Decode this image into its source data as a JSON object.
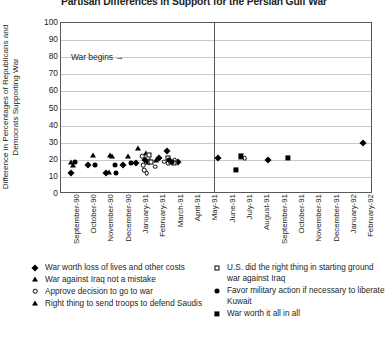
{
  "chart_data": {
    "type": "scatter",
    "title": "Partisan Differences in Support for the Persian Gulf War",
    "xlabel": "",
    "ylabel": "Difference in Percentages of Republicans and Democrats Supporting War",
    "ylim": [
      0,
      100
    ],
    "ytick_labels": [
      "0",
      "10",
      "20",
      "30",
      "40",
      "50",
      "60",
      "70",
      "80",
      "90",
      "100"
    ],
    "ytick_values": [
      0,
      10,
      20,
      30,
      40,
      50,
      60,
      70,
      80,
      90,
      100
    ],
    "grid": "horizontal",
    "legend_position": "below-plot",
    "categories": [
      "September-90",
      "October-90",
      "November-90",
      "December-90",
      "January-91",
      "February-91",
      "March-91",
      "April-91",
      "May-91",
      "June-91",
      "July-91",
      "August-91",
      "September-91",
      "October-91",
      "November-91",
      "December-91",
      "January-92",
      "February-92"
    ],
    "annotations": [
      {
        "text": "War begins",
        "arrow": "→",
        "x_category": "January-91",
        "y": 87
      }
    ],
    "series": [
      {
        "name": "War worth loss of lives and other costs",
        "marker": "diamond-filled",
        "points": [
          {
            "x": 0.05,
            "y": 12
          },
          {
            "x": 1.05,
            "y": 17
          },
          {
            "x": 2.1,
            "y": 12
          },
          {
            "x": 3.05,
            "y": 17
          },
          {
            "x": 3.8,
            "y": 18
          },
          {
            "x": 4.35,
            "y": 20
          },
          {
            "x": 4.55,
            "y": 19
          },
          {
            "x": 5.15,
            "y": 21
          },
          {
            "x": 5.6,
            "y": 25
          },
          {
            "x": 6.25,
            "y": 19
          },
          {
            "x": 8.55,
            "y": 21
          },
          {
            "x": 11.45,
            "y": 20
          },
          {
            "x": 16.9,
            "y": 30
          }
        ]
      },
      {
        "name": "War against Iraq not a mistake",
        "marker": "triangle-filled",
        "points": [
          {
            "x": 0.1,
            "y": 19
          },
          {
            "x": 1.35,
            "y": 23
          },
          {
            "x": 2.35,
            "y": 23
          },
          {
            "x": 3.35,
            "y": 22
          },
          {
            "x": 3.95,
            "y": 27
          },
          {
            "x": 4.4,
            "y": 24
          },
          {
            "x": 4.62,
            "y": 20
          },
          {
            "x": 5.0,
            "y": 20
          }
        ]
      },
      {
        "name": "Approve decision to go to war",
        "marker": "circle-open",
        "points": [
          {
            "x": 4.2,
            "y": 22
          },
          {
            "x": 4.25,
            "y": 17
          },
          {
            "x": 4.3,
            "y": 14
          },
          {
            "x": 4.45,
            "y": 12
          },
          {
            "x": 4.95,
            "y": 16
          },
          {
            "x": 5.45,
            "y": 19
          },
          {
            "x": 5.7,
            "y": 18
          },
          {
            "x": 6.05,
            "y": 20
          },
          {
            "x": 10.1,
            "y": 21
          }
        ]
      },
      {
        "name": "Right thing to send troops to defend Saudis",
        "marker": "triangle-filled",
        "points": [
          {
            "x": 0.2,
            "y": 17
          },
          {
            "x": 2.25,
            "y": 13
          },
          {
            "x": 2.45,
            "y": 22
          },
          {
            "x": 4.5,
            "y": 19
          }
        ]
      },
      {
        "name": "U.S. did the right thing in starting ground war against Iraq",
        "marker": "square-open",
        "points": [
          {
            "x": 4.55,
            "y": 23
          },
          {
            "x": 4.7,
            "y": 19
          },
          {
            "x": 5.7,
            "y": 21
          },
          {
            "x": 5.85,
            "y": 19
          },
          {
            "x": 6.0,
            "y": 18
          }
        ]
      },
      {
        "name": "Favor military action if necessary to liberate Kuwait",
        "marker": "circle-filled",
        "points": [
          {
            "x": 0.3,
            "y": 19
          },
          {
            "x": 1.45,
            "y": 17
          },
          {
            "x": 2.6,
            "y": 17
          },
          {
            "x": 2.7,
            "y": 12
          },
          {
            "x": 3.55,
            "y": 18
          },
          {
            "x": 5.75,
            "y": 20
          },
          {
            "x": 5.9,
            "y": 19
          }
        ]
      },
      {
        "name": "War worth it all in all",
        "marker": "square-filled",
        "points": [
          {
            "x": 9.9,
            "y": 22
          },
          {
            "x": 9.6,
            "y": 14
          },
          {
            "x": 12.6,
            "y": 21
          }
        ]
      }
    ]
  },
  "legend": {
    "left": [
      {
        "marker": "diamond-filled",
        "label": "War worth loss of lives and other costs"
      },
      {
        "marker": "triangle-filled",
        "label": "War against Iraq not a mistake"
      },
      {
        "marker": "circle-open",
        "label": "Approve decision to go to war"
      },
      {
        "marker": "triangle-filled",
        "label": "Right thing to send troops to defend Saudis"
      }
    ],
    "right": [
      {
        "marker": "square-open",
        "label": "U.S. did the right thing in starting ground war against Iraq"
      },
      {
        "marker": "circle-filled",
        "label": "Favor military action if necessary to liberate Kuwait"
      },
      {
        "marker": "square-filled",
        "label": "War worth it all in all"
      }
    ]
  }
}
